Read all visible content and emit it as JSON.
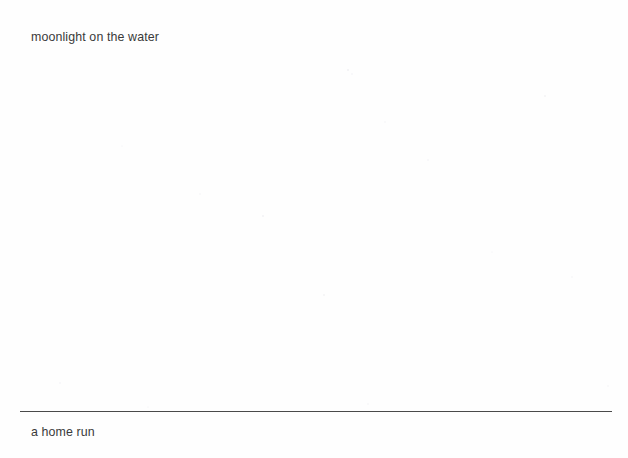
{
  "document": {
    "background_color": "#fefefe",
    "text_color": "#3a3a3a",
    "rule_color": "#4a4a4a",
    "top_note": "moonlight on the water",
    "bottom_note": "a home run",
    "divider": {
      "name": "horizontal-rule"
    }
  }
}
